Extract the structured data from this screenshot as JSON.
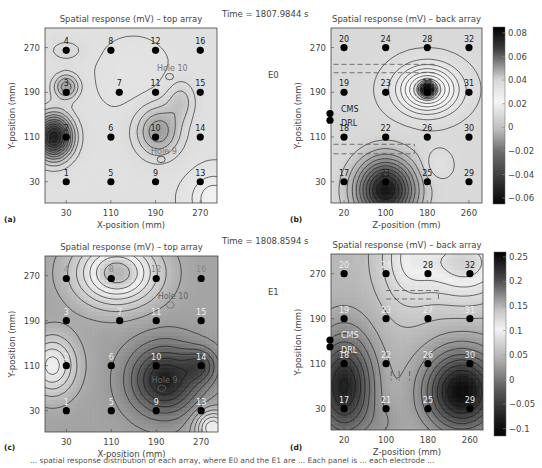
{
  "figure": {
    "caption_fragment": "... spatial response distribution of each array, where E0 and the E1 are ... Each panel is ... each electrode ..."
  },
  "chart_data": [
    {
      "id": "a",
      "panel_label": "(a)",
      "type": "heatmap",
      "title": "Spatial response (mV) – top array",
      "xlabel": "X-position (mm)",
      "ylabel": "Y-position (mm)",
      "xticks": [
        30,
        110,
        190,
        270
      ],
      "yticks": [
        30,
        110,
        190,
        270
      ],
      "xlim": [
        -8,
        300
      ],
      "ylim": [
        -8,
        305
      ],
      "time_label": "Time = 1807.9844 s",
      "condition_label": "E0",
      "electrodes": [
        {
          "n": "1",
          "x": 30,
          "y": 30
        },
        {
          "n": "2",
          "x": 30,
          "y": 110
        },
        {
          "n": "3",
          "x": 30,
          "y": 190
        },
        {
          "n": "4",
          "x": 30,
          "y": 265
        },
        {
          "n": "5",
          "x": 110,
          "y": 30
        },
        {
          "n": "6",
          "x": 110,
          "y": 110
        },
        {
          "n": "7",
          "x": 125,
          "y": 190
        },
        {
          "n": "8",
          "x": 110,
          "y": 265
        },
        {
          "n": "9",
          "x": 190,
          "y": 30
        },
        {
          "n": "10",
          "x": 190,
          "y": 110
        },
        {
          "n": "11",
          "x": 190,
          "y": 190
        },
        {
          "n": "12",
          "x": 190,
          "y": 265
        },
        {
          "n": "13",
          "x": 270,
          "y": 30
        },
        {
          "n": "14",
          "x": 270,
          "y": 110
        },
        {
          "n": "15",
          "x": 270,
          "y": 190
        },
        {
          "n": "16",
          "x": 270,
          "y": 265
        }
      ],
      "annotations": [
        {
          "text": "Hole 10",
          "x": 220,
          "y": 228
        },
        {
          "text": "Hole 9",
          "x": 205,
          "y": 80
        }
      ],
      "features": [
        {
          "kind": "minimum",
          "x": 20,
          "y": 110,
          "value": -0.06
        },
        {
          "kind": "minimum",
          "x": 30,
          "y": 200,
          "value": -0.03
        },
        {
          "kind": "minimum",
          "x": 190,
          "y": 115,
          "value": -0.035
        },
        {
          "kind": "maximum",
          "x": 290,
          "y": 10,
          "value": 0.01
        }
      ]
    },
    {
      "id": "b",
      "panel_label": "(b)",
      "type": "heatmap",
      "title": "Spatial response (mV) – back array",
      "xlabel": "Z-position (mm)",
      "ylabel": "Y-position (mm)",
      "xticks": [
        20,
        100,
        180,
        260
      ],
      "yticks": [
        30,
        110,
        190,
        270
      ],
      "xlim": [
        -5,
        285
      ],
      "ylim": [
        -8,
        305
      ],
      "colorbar": {
        "ticks": [
          0.08,
          0.06,
          0.04,
          0.02,
          0,
          -0.02,
          -0.04,
          -0.06
        ],
        "range": [
          -0.065,
          0.085
        ]
      },
      "electrodes": [
        {
          "n": "17",
          "x": 20,
          "y": 30
        },
        {
          "n": "18",
          "x": 20,
          "y": 110
        },
        {
          "n": "19",
          "x": 20,
          "y": 190
        },
        {
          "n": "20",
          "x": 20,
          "y": 270
        },
        {
          "n": "21",
          "x": 100,
          "y": 30
        },
        {
          "n": "22",
          "x": 100,
          "y": 110
        },
        {
          "n": "23",
          "x": 100,
          "y": 190
        },
        {
          "n": "24",
          "x": 100,
          "y": 270
        },
        {
          "n": "25",
          "x": 180,
          "y": 30
        },
        {
          "n": "26",
          "x": 180,
          "y": 110
        },
        {
          "n": "27",
          "x": 180,
          "y": 190
        },
        {
          "n": "28",
          "x": 180,
          "y": 270
        },
        {
          "n": "29",
          "x": 260,
          "y": 30
        },
        {
          "n": "30",
          "x": 260,
          "y": 110
        },
        {
          "n": "31",
          "x": 260,
          "y": 190
        },
        {
          "n": "32",
          "x": 260,
          "y": 270
        }
      ],
      "reference_electrodes": [
        {
          "n": "CMS",
          "x": 0,
          "y": 152
        },
        {
          "n": "DRL",
          "x": 0,
          "y": 140
        }
      ],
      "features": [
        {
          "kind": "maximum",
          "x": 180,
          "y": 195,
          "value": 0.06
        },
        {
          "kind": "minimum",
          "x": 100,
          "y": 25,
          "value": -0.06
        }
      ]
    },
    {
      "id": "c",
      "panel_label": "(c)",
      "type": "heatmap",
      "title": "Spatial response (mV) – top array",
      "xlabel": "X-position (mm)",
      "ylabel": "Y-position (mm)",
      "xticks": [
        30,
        110,
        190,
        270
      ],
      "yticks": [
        30,
        110,
        190,
        270
      ],
      "xlim": [
        -8,
        300
      ],
      "ylim": [
        -8,
        305
      ],
      "time_label": "Time = 1808.8594 s",
      "condition_label": "E1",
      "electrodes": [
        {
          "n": "1",
          "x": 30,
          "y": 30
        },
        {
          "n": "2",
          "x": 30,
          "y": 110
        },
        {
          "n": "3",
          "x": 30,
          "y": 190
        },
        {
          "n": "4",
          "x": 30,
          "y": 265
        },
        {
          "n": "5",
          "x": 110,
          "y": 30
        },
        {
          "n": "6",
          "x": 110,
          "y": 110
        },
        {
          "n": "7",
          "x": 125,
          "y": 190
        },
        {
          "n": "8",
          "x": 110,
          "y": 265
        },
        {
          "n": "9",
          "x": 190,
          "y": 30
        },
        {
          "n": "10",
          "x": 190,
          "y": 110
        },
        {
          "n": "11",
          "x": 190,
          "y": 190
        },
        {
          "n": "12",
          "x": 190,
          "y": 265
        },
        {
          "n": "13",
          "x": 270,
          "y": 30
        },
        {
          "n": "14",
          "x": 270,
          "y": 110
        },
        {
          "n": "15",
          "x": 270,
          "y": 190
        },
        {
          "n": "16",
          "x": 270,
          "y": 265
        }
      ],
      "annotations": [
        {
          "text": "Hole 10",
          "x": 220,
          "y": 228
        },
        {
          "text": "Hole 9",
          "x": 205,
          "y": 80
        }
      ],
      "features": [
        {
          "kind": "maximum",
          "x": 110,
          "y": 270,
          "value": 0.15
        },
        {
          "kind": "maximum",
          "x": 20,
          "y": 110,
          "value": 0.1
        },
        {
          "kind": "minimum",
          "x": 200,
          "y": 90,
          "value": -0.1
        }
      ]
    },
    {
      "id": "d",
      "panel_label": "(d)",
      "type": "heatmap",
      "title": "Spatial response (mV) – back array",
      "xlabel": "Z-position (mm)",
      "ylabel": "Y-position (mm)",
      "xticks": [
        20,
        100,
        180,
        260
      ],
      "yticks": [
        30,
        110,
        190,
        270
      ],
      "xlim": [
        -5,
        285
      ],
      "ylim": [
        -8,
        305
      ],
      "colorbar": {
        "ticks": [
          0.25,
          0.2,
          0.15,
          0.1,
          0.05,
          0,
          -0.05,
          -0.1
        ],
        "range": [
          -0.115,
          0.26
        ]
      },
      "electrodes": [
        {
          "n": "17",
          "x": 20,
          "y": 30
        },
        {
          "n": "18",
          "x": 20,
          "y": 110
        },
        {
          "n": "19",
          "x": 20,
          "y": 190
        },
        {
          "n": "20",
          "x": 20,
          "y": 270
        },
        {
          "n": "21",
          "x": 100,
          "y": 30
        },
        {
          "n": "22",
          "x": 100,
          "y": 110
        },
        {
          "n": "23",
          "x": 100,
          "y": 190
        },
        {
          "n": "24",
          "x": 100,
          "y": 270
        },
        {
          "n": "25",
          "x": 180,
          "y": 30
        },
        {
          "n": "26",
          "x": 180,
          "y": 110
        },
        {
          "n": "27",
          "x": 180,
          "y": 190
        },
        {
          "n": "28",
          "x": 180,
          "y": 270
        },
        {
          "n": "29",
          "x": 260,
          "y": 30
        },
        {
          "n": "30",
          "x": 260,
          "y": 110
        },
        {
          "n": "31",
          "x": 260,
          "y": 190
        },
        {
          "n": "32",
          "x": 260,
          "y": 270
        }
      ],
      "reference_electrodes": [
        {
          "n": "CMS",
          "x": 0,
          "y": 152
        },
        {
          "n": "DRL",
          "x": 0,
          "y": 140
        }
      ],
      "features": [
        {
          "kind": "maximum",
          "x": 260,
          "y": 280,
          "value": 0.12
        },
        {
          "kind": "minimum",
          "x": 20,
          "y": 80,
          "value": -0.1
        },
        {
          "kind": "minimum",
          "x": 240,
          "y": 60,
          "value": -0.1
        }
      ]
    }
  ]
}
